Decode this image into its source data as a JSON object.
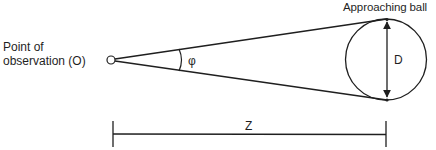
{
  "diagram": {
    "observer": {
      "label_line1": "Point of",
      "label_line2": "observation (O)"
    },
    "ball": {
      "label": "Approaching ball",
      "diameter_label": "D"
    },
    "angle": {
      "label": "φ"
    },
    "distance": {
      "label": "Z"
    },
    "colors": {
      "stroke": "#1f1f1f",
      "background": "#ffffff"
    }
  }
}
